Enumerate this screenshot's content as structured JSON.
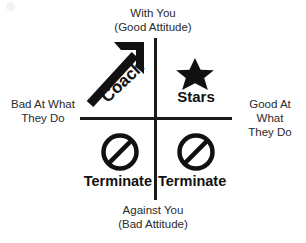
{
  "diagram": {
    "type": "2x2-quadrant-matrix",
    "colors": {
      "ink": "#1a1a1a",
      "caption": "#2b2b2b",
      "background": "#ffffff"
    },
    "axes": {
      "top": {
        "line1": "With You",
        "line2": "(Good Attitude)"
      },
      "bottom": {
        "line1": "Against You",
        "line2": "(Bad Attitude)"
      },
      "left": {
        "line1": "Bad At What",
        "line2": "They Do"
      },
      "right": {
        "line1": "Good At",
        "line2": "What",
        "line3": "They Do"
      }
    },
    "quadrants": {
      "top_left": {
        "label": "Coach",
        "icon": "up-right-arrow-icon"
      },
      "top_right": {
        "label": "Stars",
        "icon": "star-icon"
      },
      "bottom_left": {
        "label": "Terminate",
        "icon": "no-entry-icon"
      },
      "bottom_right": {
        "label": "Terminate",
        "icon": "no-entry-icon"
      }
    }
  }
}
